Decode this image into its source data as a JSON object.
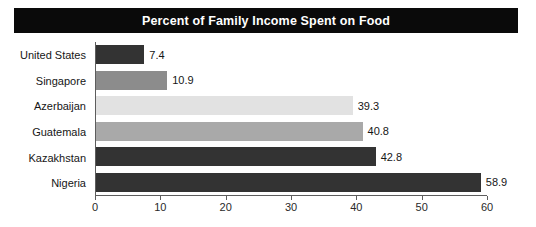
{
  "chart_data": {
    "type": "bar",
    "orientation": "horizontal",
    "title": "Percent of Family Income Spent on Food",
    "xlabel": "",
    "ylabel": "",
    "categories": [
      "United States",
      "Singapore",
      "Azerbaijan",
      "Guatemala",
      "Kazakhstan",
      "Nigeria"
    ],
    "values": [
      7.4,
      10.9,
      39.3,
      40.8,
      42.8,
      58.9
    ],
    "value_labels": [
      "7.4",
      "10.9",
      "39.3",
      "40.8",
      "42.8",
      "58.9"
    ],
    "bar_colors": [
      "#333333",
      "#8c8c8c",
      "#e2e2e2",
      "#a9a9a9",
      "#333333",
      "#333333"
    ],
    "xlim": [
      0,
      60
    ],
    "xticks": [
      0,
      10,
      20,
      30,
      40,
      50,
      60
    ],
    "xtick_labels": [
      "0",
      "10",
      "20",
      "30",
      "40",
      "50",
      "60"
    ],
    "grid": false,
    "legend": null
  },
  "style": {
    "title_bg": "#0a0a0a",
    "title_fg": "#ffffff",
    "axis_color": "#5d5d5d",
    "text_color": "#161616",
    "background": "#ffffff"
  }
}
